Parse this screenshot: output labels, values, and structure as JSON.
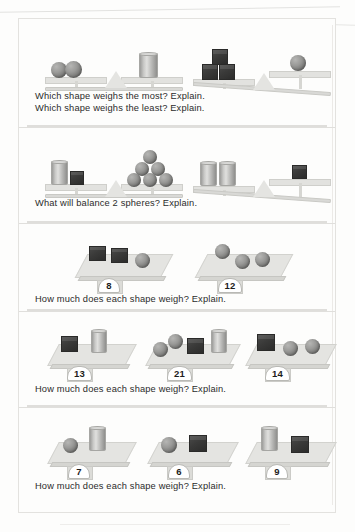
{
  "worksheet": {
    "panels": [
      {
        "id": "panel-1",
        "prompt_lines": [
          "Which shape weighs the most? Explain.",
          "Which shape weighs the least? Explain."
        ],
        "type": "balance",
        "balances": [
          {
            "left_items": [
              "sphere",
              "sphere"
            ],
            "right_items": [
              "cylinder"
            ],
            "tilt": "level"
          },
          {
            "left_items": [
              "cube",
              "cube",
              "cube"
            ],
            "right_items": [
              "sphere"
            ],
            "tilt": "left"
          }
        ]
      },
      {
        "id": "panel-2",
        "prompt_lines": [
          "What will balance 2 spheres? Explain."
        ],
        "type": "balance",
        "balances": [
          {
            "left_items": [
              "cylinder",
              "cube"
            ],
            "right_items": [
              "sphere",
              "sphere",
              "sphere",
              "sphere",
              "sphere",
              "sphere"
            ],
            "tilt": "level"
          },
          {
            "left_items": [
              "cylinder",
              "cylinder"
            ],
            "right_items": [
              "cube"
            ],
            "tilt": "left"
          }
        ]
      },
      {
        "id": "panel-3",
        "prompt_lines": [
          "How much does each shape weigh? Explain."
        ],
        "type": "scale",
        "scales": [
          {
            "items": [
              "cube",
              "cube",
              "sphere"
            ],
            "reading": "8"
          },
          {
            "items": [
              "sphere",
              "sphere",
              "sphere"
            ],
            "reading": "12"
          }
        ]
      },
      {
        "id": "panel-4",
        "prompt_lines": [
          "How much does each shape weigh? Explain."
        ],
        "type": "scale",
        "scales": [
          {
            "items": [
              "cube",
              "cylinder"
            ],
            "reading": "13"
          },
          {
            "items": [
              "sphere",
              "sphere",
              "cube",
              "cylinder"
            ],
            "reading": "21"
          },
          {
            "items": [
              "cube",
              "sphere",
              "sphere"
            ],
            "reading": "14"
          }
        ]
      },
      {
        "id": "panel-5",
        "prompt_lines": [
          "How much does each shape weigh? Explain."
        ],
        "type": "scale",
        "scales": [
          {
            "items": [
              "sphere",
              "cylinder"
            ],
            "reading": "7"
          },
          {
            "items": [
              "sphere",
              "cube"
            ],
            "reading": "6"
          },
          {
            "items": [
              "cylinder",
              "cube"
            ],
            "reading": "9"
          }
        ]
      }
    ],
    "readings": {
      "p3s1": "8",
      "p3s2": "12",
      "p4s1": "13",
      "p4s2": "21",
      "p4s3": "14",
      "p5s1": "7",
      "p5s2": "6",
      "p5s3": "9"
    },
    "prompts": {
      "p1a": "Which shape weighs the most? Explain.",
      "p1b": "Which shape weighs the least? Explain.",
      "p2": "What will balance 2 spheres? Explain.",
      "p3": "How much does each shape weigh? Explain.",
      "p4": "How much does each shape weigh? Explain.",
      "p5": "How much does each shape weigh? Explain."
    },
    "colors": {
      "page_bg": "#fdfdfc",
      "sheet_border": "#e3e2df",
      "sphere": "#8a8a88",
      "cube": "#343433",
      "cylinder": "#c2c2c0",
      "pan": "#e2e2df",
      "dial_bg": "#ffffff",
      "text": "#2b2b2b"
    }
  }
}
